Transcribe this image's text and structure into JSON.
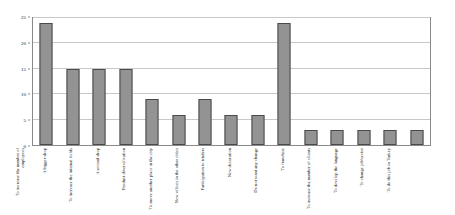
{
  "chart_data": {
    "type": "bar",
    "title": "",
    "subtitle": "",
    "xlabel": "",
    "ylabel": "",
    "ylim": [
      0,
      25
    ],
    "yticks": [
      0,
      5,
      10,
      15,
      20,
      25
    ],
    "ytick_labels": [
      "0",
      "5",
      "10",
      "15",
      "20",
      "25"
    ],
    "grid": true,
    "legend": null,
    "bar_color": "#939393",
    "bar_edge_color": "#4a4a4a",
    "frame_color": "#8a8a8a",
    "gridline_color": "#c8c8c8",
    "categories": [
      "To increase the number of employees",
      "A bigger shop",
      "To increase the internal fields",
      "A second shop",
      "Product diversification",
      "To move another place in the city",
      "New offices in the other cities",
      "Participation to tenders",
      "New decoration",
      "Do not want any change",
      "To franchise",
      "To increase the number of clients",
      "To develop the language",
      "To change job/sector",
      "To do this job in Turkey"
    ],
    "values": [
      24,
      15,
      15,
      15,
      9,
      6,
      9,
      6,
      6,
      24,
      3,
      3,
      3,
      3,
      3
    ]
  }
}
